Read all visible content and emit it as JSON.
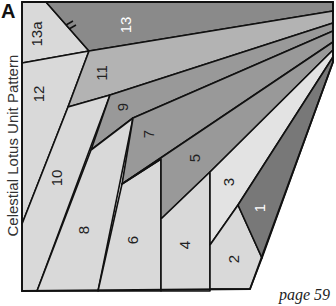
{
  "figure": {
    "label": "A",
    "caption": "Celestial Lotus Unit Pattern",
    "page": "page 59"
  },
  "colors": {
    "light": "#d9d9d9",
    "lighter": "#e3e3e3",
    "mid": "#b3b3b3",
    "dark": "#999999",
    "darker": "#8a8a8a",
    "darkest": "#787878",
    "outline": "#111111"
  },
  "patches": [
    {
      "id": "13a",
      "label": "13a",
      "shade": "light",
      "text_color": "#222"
    },
    {
      "id": "13",
      "label": "13",
      "shade": "darker",
      "text_color": "#ffffff"
    },
    {
      "id": "12",
      "label": "12",
      "shade": "light",
      "text_color": "#222"
    },
    {
      "id": "11",
      "label": "11",
      "shade": "mid",
      "text_color": "#222"
    },
    {
      "id": "10",
      "label": "10",
      "shade": "light",
      "text_color": "#222"
    },
    {
      "id": "9",
      "label": "9",
      "shade": "dark",
      "text_color": "#222"
    },
    {
      "id": "8",
      "label": "8",
      "shade": "light",
      "text_color": "#222"
    },
    {
      "id": "7",
      "label": "7",
      "shade": "dark",
      "text_color": "#222"
    },
    {
      "id": "6",
      "label": "6",
      "shade": "light",
      "text_color": "#222"
    },
    {
      "id": "5",
      "label": "5",
      "shade": "dark",
      "text_color": "#222"
    },
    {
      "id": "4",
      "label": "4",
      "shade": "light",
      "text_color": "#222"
    },
    {
      "id": "3",
      "label": "3",
      "shade": "lighter",
      "text_color": "#222"
    },
    {
      "id": "2",
      "label": "2",
      "shade": "light",
      "text_color": "#222"
    },
    {
      "id": "1",
      "label": "1",
      "shade": "darkest",
      "text_color": "#ffffff"
    }
  ]
}
